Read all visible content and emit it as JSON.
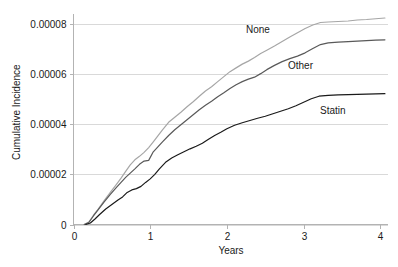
{
  "chart_data": {
    "type": "line",
    "title": "",
    "xlabel": "Years",
    "ylabel": "Cumulative Incidence",
    "xlim": [
      0,
      4.1
    ],
    "ylim": [
      0,
      8.4e-05
    ],
    "grid": true,
    "legend_position": "inline-annotations",
    "xticks": [
      "0",
      "1",
      "2",
      "3",
      "4"
    ],
    "xtick_values": [
      0,
      1,
      2,
      3,
      4
    ],
    "yticks": [
      "0",
      "0.00002",
      "0.00004",
      "0.00006",
      "0.00008"
    ],
    "ytick_values": [
      0,
      2e-05,
      4e-05,
      6e-05,
      8e-05
    ],
    "series": [
      {
        "name": "None",
        "label": "None",
        "color": "#a6a6a6",
        "x": [
          0.14,
          0.2,
          0.26,
          0.32,
          0.4,
          0.48,
          0.56,
          0.62,
          0.68,
          0.74,
          0.8,
          0.86,
          0.92,
          0.98,
          1.04,
          1.1,
          1.16,
          1.24,
          1.32,
          1.4,
          1.48,
          1.56,
          1.64,
          1.72,
          1.8,
          1.88,
          1.96,
          2.04,
          2.12,
          2.2,
          2.28,
          2.36,
          2.44,
          2.52,
          2.62,
          2.72,
          2.82,
          2.92,
          3.02,
          3.12,
          3.22,
          3.32,
          3.45,
          3.58,
          3.7,
          3.82,
          3.94,
          4.06
        ],
        "y": [
          0.0,
          1e-06,
          3.7e-06,
          6e-06,
          9.5e-06,
          1.28e-05,
          1.6e-05,
          1.85e-05,
          2.12e-05,
          2.38e-05,
          2.58e-05,
          2.72e-05,
          2.88e-05,
          3.07e-05,
          3.3e-05,
          3.54e-05,
          3.78e-05,
          4.08e-05,
          4.28e-05,
          4.48e-05,
          4.7e-05,
          4.9e-05,
          5.12e-05,
          5.33e-05,
          5.5e-05,
          5.7e-05,
          5.9e-05,
          6.1e-05,
          6.25e-05,
          6.4e-05,
          6.52e-05,
          6.66e-05,
          6.82e-05,
          6.95e-05,
          7.12e-05,
          7.3e-05,
          7.48e-05,
          7.65e-05,
          7.82e-05,
          7.96e-05,
          8.06e-05,
          8.08e-05,
          8.1e-05,
          8.12e-05,
          8.16e-05,
          8.18e-05,
          8.21e-05,
          8.24e-05
        ]
      },
      {
        "name": "Other",
        "label": "Other",
        "color": "#595959",
        "x": [
          0.14,
          0.2,
          0.26,
          0.32,
          0.4,
          0.48,
          0.56,
          0.62,
          0.68,
          0.74,
          0.8,
          0.86,
          0.92,
          0.98,
          1.04,
          1.1,
          1.16,
          1.24,
          1.32,
          1.4,
          1.48,
          1.56,
          1.64,
          1.72,
          1.8,
          1.88,
          1.96,
          2.04,
          2.12,
          2.2,
          2.28,
          2.36,
          2.44,
          2.52,
          2.62,
          2.72,
          2.82,
          2.92,
          3.02,
          3.12,
          3.22,
          3.32,
          3.45,
          3.58,
          3.7,
          3.82,
          3.94,
          4.06
        ],
        "y": [
          0.0,
          8e-07,
          3.4e-06,
          5.8e-06,
          9e-06,
          1.2e-05,
          1.48e-05,
          1.68e-05,
          1.88e-05,
          2.05e-05,
          2.22e-05,
          2.4e-05,
          2.53e-05,
          2.56e-05,
          2.9e-05,
          3.1e-05,
          3.3e-05,
          3.55e-05,
          3.78e-05,
          3.98e-05,
          4.18e-05,
          4.38e-05,
          4.58e-05,
          4.76e-05,
          4.92e-05,
          5.1e-05,
          5.26e-05,
          5.43e-05,
          5.58e-05,
          5.7e-05,
          5.8e-05,
          5.88e-05,
          6.02e-05,
          6.18e-05,
          6.35e-05,
          6.5e-05,
          6.62e-05,
          6.72e-05,
          6.85e-05,
          7.02e-05,
          7.18e-05,
          7.25e-05,
          7.28e-05,
          7.3e-05,
          7.32e-05,
          7.34e-05,
          7.36e-05,
          7.37e-05
        ]
      },
      {
        "name": "Statin",
        "label": "Statin",
        "color": "#1a1a1a",
        "x": [
          0.16,
          0.22,
          0.28,
          0.34,
          0.42,
          0.5,
          0.58,
          0.64,
          0.7,
          0.76,
          0.82,
          0.88,
          0.94,
          1.0,
          1.06,
          1.12,
          1.2,
          1.28,
          1.36,
          1.44,
          1.52,
          1.6,
          1.68,
          1.76,
          1.84,
          1.92,
          2.0,
          2.1,
          2.2,
          2.3,
          2.4,
          2.5,
          2.6,
          2.7,
          2.8,
          2.9,
          3.0,
          3.1,
          3.2,
          3.32,
          3.45,
          3.58,
          3.7,
          3.82,
          3.94,
          4.06
        ],
        "y": [
          0.0,
          6e-07,
          2.2e-06,
          4e-06,
          6.2e-06,
          8e-06,
          9.8e-06,
          1.1e-05,
          1.28e-05,
          1.38e-05,
          1.43e-05,
          1.52e-05,
          1.68e-05,
          1.82e-05,
          2e-05,
          2.22e-05,
          2.48e-05,
          2.65e-05,
          2.78e-05,
          2.9e-05,
          3.02e-05,
          3.12e-05,
          3.24e-05,
          3.4e-05,
          3.55e-05,
          3.68e-05,
          3.82e-05,
          3.96e-05,
          4.06e-05,
          4.15e-05,
          4.24e-05,
          4.32e-05,
          4.42e-05,
          4.52e-05,
          4.62e-05,
          4.74e-05,
          4.88e-05,
          5.02e-05,
          5.12e-05,
          5.15e-05,
          5.17e-05,
          5.18e-05,
          5.19e-05,
          5.2e-05,
          5.21e-05,
          5.22e-05
        ]
      }
    ],
    "annotations": [
      {
        "text": "None",
        "x_px": 246,
        "y_px": 33
      },
      {
        "text": "Other",
        "x_px": 288,
        "y_px": 69
      },
      {
        "text": "Statin",
        "x_px": 320,
        "y_px": 114
      }
    ]
  }
}
